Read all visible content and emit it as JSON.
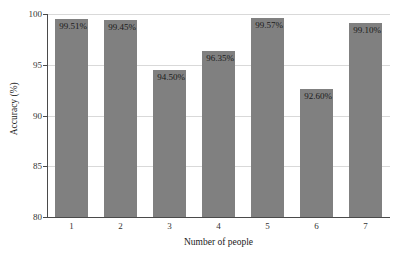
{
  "chart_data": {
    "type": "bar",
    "title": "",
    "xlabel": "Number of people",
    "ylabel": "Accuracy (%)",
    "categories": [
      "1",
      "2",
      "3",
      "4",
      "5",
      "6",
      "7"
    ],
    "values": [
      99.51,
      99.45,
      94.5,
      96.35,
      99.57,
      92.6,
      99.1
    ],
    "data_labels": [
      "99.51%",
      "99.45%",
      "94.50%",
      "96.35%",
      "99.57%",
      "92.60%",
      "99.10%"
    ],
    "ylim": [
      80,
      100
    ],
    "yticks": [
      80,
      85,
      90,
      95,
      100
    ],
    "ytick_labels": [
      "80",
      "85",
      "90",
      "95",
      "100"
    ],
    "grid": true,
    "grid_axis": "y",
    "legend": "none",
    "bar_color": "#808080",
    "grid_color": "#d9d9d9",
    "axis_color": "#4a4a4a",
    "background": "#ffffff"
  }
}
